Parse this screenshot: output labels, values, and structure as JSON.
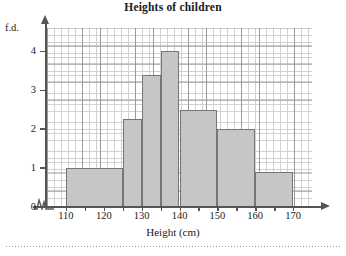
{
  "chart_data": {
    "type": "bar",
    "title": "Heights of children",
    "xlabel": "Height (cm)",
    "ylabel": "f.d.",
    "xlim": [
      105,
      175
    ],
    "ylim": [
      0,
      4.6
    ],
    "grid": true,
    "legend": "none",
    "axis_break_x": true,
    "x_tick_labels": [
      "110",
      "120",
      "130",
      "140",
      "150",
      "160",
      "170"
    ],
    "x_tick_values": [
      110,
      120,
      130,
      140,
      150,
      160,
      170
    ],
    "x_minor_tick_step": 5,
    "y_tick_labels": [
      "0",
      "1",
      "2",
      "3",
      "4"
    ],
    "y_tick_values": [
      0,
      1,
      2,
      3,
      4
    ],
    "y_gridline_step": 0.5,
    "bar_fill_color": "#c6c6c6",
    "bar_edge_color": "#767676",
    "bins": [
      {
        "label": "110-125",
        "start": 110,
        "end": 125,
        "fd": 1.0,
        "frequency": 15
      },
      {
        "label": "125-130",
        "start": 125,
        "end": 130,
        "fd": 2.25,
        "frequency": 11.25
      },
      {
        "label": "130-135",
        "start": 130,
        "end": 135,
        "fd": 3.4,
        "frequency": 17
      },
      {
        "label": "135-140",
        "start": 135,
        "end": 140,
        "fd": 4.0,
        "frequency": 20
      },
      {
        "label": "140-150",
        "start": 140,
        "end": 150,
        "fd": 2.5,
        "frequency": 25
      },
      {
        "label": "150-160",
        "start": 150,
        "end": 160,
        "fd": 2.0,
        "frequency": 20
      },
      {
        "label": "160-170",
        "start": 160,
        "end": 170,
        "fd": 0.9,
        "frequency": 9
      }
    ]
  }
}
